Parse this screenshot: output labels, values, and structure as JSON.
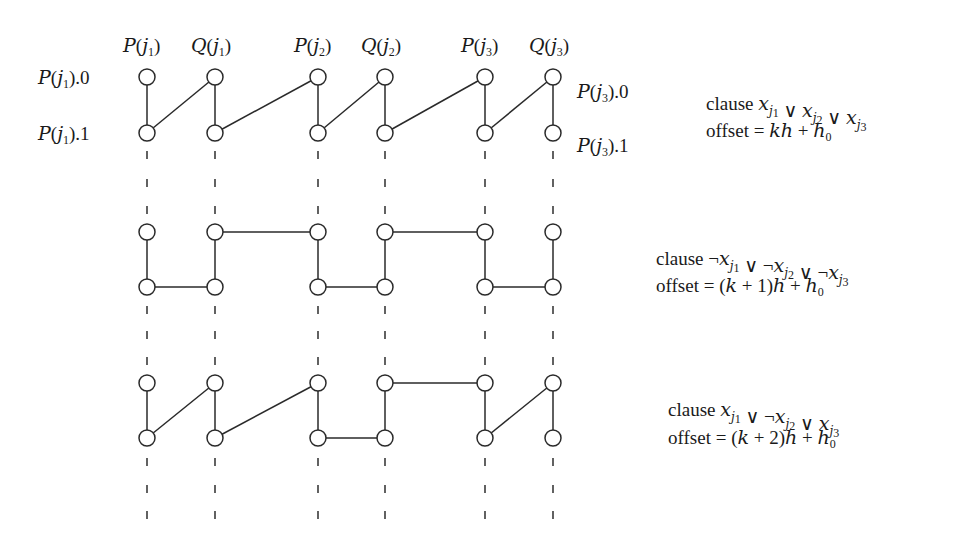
{
  "figure": {
    "columns": [
      {
        "id": "P1",
        "label": "P(j1)",
        "head": "P",
        "idx": "1",
        "x": 147
      },
      {
        "id": "Q1",
        "label": "Q(j1)",
        "head": "Q",
        "idx": "1",
        "x": 215
      },
      {
        "id": "P2",
        "label": "P(j2)",
        "head": "P",
        "idx": "2",
        "x": 318
      },
      {
        "id": "Q2",
        "label": "Q(j2)",
        "head": "Q",
        "idx": "2",
        "x": 385
      },
      {
        "id": "P3",
        "label": "P(j3)",
        "head": "P",
        "idx": "3",
        "x": 485
      },
      {
        "id": "Q3",
        "label": "Q(j3)",
        "head": "Q",
        "idx": "3",
        "x": 553
      }
    ],
    "row_labels": {
      "left_top": "P(j1).0",
      "left_bottom": "P(j1).1",
      "right_top": "P(j3).0",
      "right_bottom": "P(j3).1"
    },
    "gadgets": [
      {
        "name": "clause-1",
        "top_y": 77,
        "bottom_y": 133,
        "clause_label": "clause x_{j1} ∨ x_{j2} ∨ x_{j3}",
        "clause_text": {
          "prefix": "clause",
          "literals": [
            {
              "neg": false,
              "idx": "1"
            },
            {
              "neg": false,
              "idx": "2"
            },
            {
              "neg": false,
              "idx": "3"
            }
          ]
        },
        "offset_label": "offset = kh + h0",
        "offset_text": "offset = kh + h",
        "offset_sub": "0",
        "label_x": 706,
        "edges": [
          [
            "P1.t",
            "P1.b"
          ],
          [
            "P1.b",
            "Q1.t"
          ],
          [
            "Q1.t",
            "Q1.b"
          ],
          [
            "Q1.b",
            "P2.t"
          ],
          [
            "P2.t",
            "P2.b"
          ],
          [
            "P2.b",
            "Q2.t"
          ],
          [
            "Q2.t",
            "Q2.b"
          ],
          [
            "Q2.b",
            "P3.t"
          ],
          [
            "P3.t",
            "P3.b"
          ],
          [
            "P3.b",
            "Q3.t"
          ],
          [
            "Q3.t",
            "Q3.b"
          ]
        ]
      },
      {
        "name": "clause-2",
        "top_y": 232,
        "bottom_y": 287,
        "clause_label": "clause ¬x_{j1} ∨ ¬x_{j2} ∨ ¬x_{j3}",
        "clause_text": {
          "prefix": "clause",
          "literals": [
            {
              "neg": true,
              "idx": "1"
            },
            {
              "neg": true,
              "idx": "2"
            },
            {
              "neg": true,
              "idx": "3"
            }
          ]
        },
        "offset_label": "offset = (k + 1)h + h0",
        "offset_text": "offset = (k + 1)h + h",
        "offset_sub": "0",
        "label_x": 656,
        "edges": [
          [
            "P1.t",
            "P1.b"
          ],
          [
            "P1.b",
            "Q1.b"
          ],
          [
            "Q1.b",
            "Q1.t"
          ],
          [
            "Q1.t",
            "P2.t"
          ],
          [
            "P2.t",
            "P2.b"
          ],
          [
            "P2.b",
            "Q2.b"
          ],
          [
            "Q2.b",
            "Q2.t"
          ],
          [
            "Q2.t",
            "P3.t"
          ],
          [
            "P3.t",
            "P3.b"
          ],
          [
            "P3.b",
            "Q3.b"
          ],
          [
            "Q3.b",
            "Q3.t"
          ]
        ]
      },
      {
        "name": "clause-3",
        "top_y": 383,
        "bottom_y": 438,
        "clause_label": "clause x_{j1} ∨ ¬x_{j2} ∨ x_{j3}",
        "clause_text": {
          "prefix": "clause",
          "literals": [
            {
              "neg": false,
              "idx": "1"
            },
            {
              "neg": true,
              "idx": "2"
            },
            {
              "neg": false,
              "idx": "3"
            }
          ]
        },
        "offset_label": "offset = (k + 2)h + h0",
        "offset_text": "offset = (k + 2)h + h",
        "offset_sub": "0",
        "label_x": 668,
        "edges": [
          [
            "P1.t",
            "P1.b"
          ],
          [
            "P1.b",
            "Q1.t"
          ],
          [
            "Q1.t",
            "Q1.b"
          ],
          [
            "Q1.b",
            "P2.t"
          ],
          [
            "P2.t",
            "P2.b"
          ],
          [
            "P2.b",
            "Q2.b"
          ],
          [
            "Q2.b",
            "Q2.t"
          ],
          [
            "Q2.t",
            "P3.t"
          ],
          [
            "P3.t",
            "P3.b"
          ],
          [
            "P3.b",
            "Q3.t"
          ],
          [
            "Q3.t",
            "Q3.b"
          ]
        ]
      }
    ],
    "dash_rows_y": [
      155,
      183,
      210,
      310,
      335,
      361,
      462,
      489,
      515
    ],
    "node_radius": 8,
    "colors": {
      "ink": "#2a2a2a",
      "background": "#ffffff"
    }
  }
}
